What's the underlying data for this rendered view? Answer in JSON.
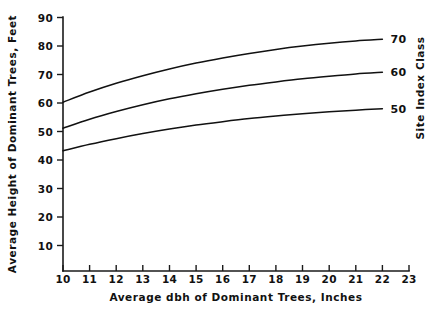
{
  "chart_data": {
    "type": "line",
    "title": "",
    "xlabel": "Average dbh of Dominant Trees, Inches",
    "ylabel": "Average Height of Dominant Trees, Feet",
    "y2label": "Site Index Class",
    "xlim": [
      10,
      23
    ],
    "ylim": [
      0,
      90
    ],
    "grid": false,
    "legend_position": "right-of-curve-ends",
    "xticks": [
      "10",
      "11",
      "12",
      "13",
      "14",
      "15",
      "16",
      "17",
      "18",
      "19",
      "20",
      "21",
      "22",
      "23"
    ],
    "yticks": [
      "10",
      "20",
      "30",
      "40",
      "50",
      "60",
      "70",
      "80",
      "90"
    ],
    "x": [
      10,
      11,
      12,
      13,
      14,
      15,
      16,
      17,
      18,
      19,
      20,
      21,
      22
    ],
    "series": [
      {
        "name": "70",
        "label": "70",
        "values": [
          59.8,
          63.4,
          66.5,
          69.2,
          71.6,
          73.7,
          75.5,
          77.1,
          78.5,
          79.7,
          80.7,
          81.5,
          82.1
        ]
      },
      {
        "name": "60",
        "label": "60",
        "values": [
          50.6,
          53.8,
          56.5,
          58.9,
          61.0,
          62.8,
          64.4,
          65.8,
          67.0,
          68.1,
          69.0,
          69.8,
          70.4
        ]
      },
      {
        "name": "50",
        "label": "50",
        "values": [
          42.6,
          44.9,
          46.9,
          48.7,
          50.3,
          51.7,
          52.9,
          54.0,
          54.9,
          55.7,
          56.4,
          57.0,
          57.5
        ]
      }
    ]
  },
  "axes": {
    "x_label": "Average dbh of Dominant Trees, Inches",
    "y_label": "Average Height of Dominant Trees, Feet",
    "y2_label": "Site Index Class"
  }
}
